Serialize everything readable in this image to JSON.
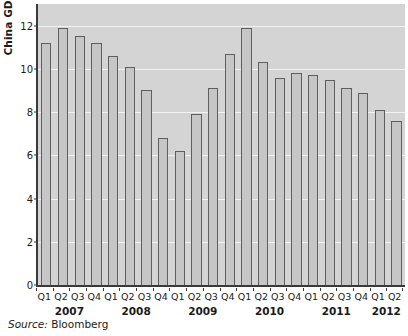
{
  "chart_data": {
    "type": "bar",
    "title": "",
    "ylabel": "China GDP",
    "xlabel": "",
    "ylim": [
      0,
      13
    ],
    "yticks": [
      0,
      2,
      4,
      6,
      8,
      10,
      12
    ],
    "ytick_labels": [
      "0",
      "2",
      "4",
      "6",
      "8",
      "10",
      "12"
    ],
    "grid": true,
    "legend": "none",
    "source": "Bloomberg",
    "source_prefix": "Source:",
    "categories": [
      "Q1",
      "Q2",
      "Q3",
      "Q4",
      "Q1",
      "Q2",
      "Q3",
      "Q4",
      "Q1",
      "Q2",
      "Q3",
      "Q4",
      "Q1",
      "Q2",
      "Q3",
      "Q4",
      "Q1",
      "Q2",
      "Q3",
      "Q4",
      "Q1",
      "Q2"
    ],
    "values": [
      11.2,
      11.9,
      11.5,
      11.2,
      10.6,
      10.1,
      9.0,
      6.8,
      6.2,
      7.9,
      9.1,
      10.7,
      11.9,
      10.3,
      9.6,
      9.8,
      9.7,
      9.5,
      9.1,
      8.9,
      8.1,
      7.6
    ],
    "year_groups": [
      {
        "year": "2007",
        "start": 0,
        "count": 4
      },
      {
        "year": "2008",
        "start": 4,
        "count": 4
      },
      {
        "year": "2009",
        "start": 8,
        "count": 4
      },
      {
        "year": "2010",
        "start": 12,
        "count": 4
      },
      {
        "year": "2011",
        "start": 16,
        "count": 4
      },
      {
        "year": "2012",
        "start": 20,
        "count": 2
      }
    ],
    "colors": {
      "bar_fill": "#c6c6c6",
      "bar_edge": "#5e5e5e",
      "plot_background": "#d4d4d4",
      "gridline": "#f2f2f2",
      "axis": "#3a3a3a",
      "text": "#1a1a1a",
      "page_background": "#ffffff"
    }
  }
}
